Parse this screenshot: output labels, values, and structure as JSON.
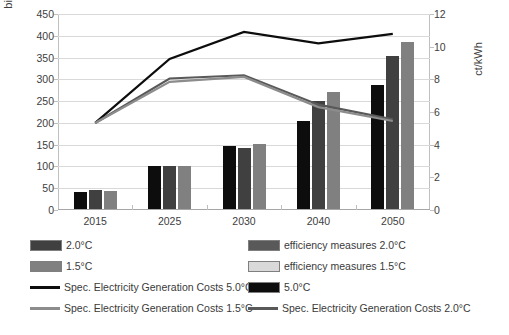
{
  "chart_data": {
    "type": "bar",
    "title": "",
    "categories": [
      "2015",
      "2025",
      "2030",
      "2040",
      "2050"
    ],
    "xlabel": "",
    "ylabel": "billion $",
    "ylabel_secondary": "ct/kWh",
    "ylim": [
      0,
      450
    ],
    "ylim_secondary": [
      0,
      12
    ],
    "yticks": [
      0,
      50,
      100,
      150,
      200,
      250,
      300,
      350,
      400,
      450
    ],
    "yticks_secondary": [
      0,
      2,
      4,
      6,
      8,
      10,
      12
    ],
    "grid": true,
    "legend_position": "bottom",
    "bar_series": [
      {
        "name": "5.0°C",
        "color": "#0d0d0d",
        "axis": "left",
        "values": [
          40,
          99,
          145,
          203,
          284
        ]
      },
      {
        "name": "2.0°C",
        "color": "#404040",
        "axis": "left",
        "values": [
          43,
          99,
          140,
          247,
          352
        ]
      },
      {
        "name": "1.5°C",
        "color": "#808080",
        "axis": "left",
        "values": [
          41,
          99,
          150,
          268,
          383
        ]
      }
    ],
    "line_series": [
      {
        "name": "Spec. Electricity Generation Costs 5.0°C",
        "color": "#0d0d0d",
        "axis": "right",
        "values": [
          5.33,
          9.25,
          10.9,
          10.2,
          10.78
        ]
      },
      {
        "name": "Spec. Electricity Generation Costs 2.0°C",
        "color": "#595959",
        "axis": "right",
        "values": [
          5.33,
          8.05,
          8.25,
          6.45,
          5.55
        ]
      },
      {
        "name": "Spec. Electricity Generation Costs 1.5°C",
        "color": "#8c8c8c",
        "axis": "right",
        "values": [
          5.33,
          7.85,
          8.15,
          6.3,
          5.45
        ]
      }
    ]
  },
  "axes": {
    "left_title": "billion $",
    "right_title": "ct/kWh",
    "left_ticks": [
      "450",
      "400",
      "350",
      "300",
      "250",
      "200",
      "150",
      "100",
      "50",
      "0"
    ],
    "right_ticks": [
      "12",
      "10",
      "8",
      "6",
      "4",
      "2",
      "0"
    ],
    "x_ticks": [
      "2015",
      "2025",
      "2030",
      "2040",
      "2050"
    ]
  },
  "legend": {
    "left_column": [
      {
        "label": "2.0°C",
        "type": "bar",
        "color": "#404040"
      },
      {
        "label": "1.5°C",
        "type": "bar",
        "color": "#808080"
      },
      {
        "label": "Spec. Electricity Generation Costs 5.0°C",
        "type": "line",
        "color": "#0d0d0d"
      },
      {
        "label": "Spec. Electricity Generation Costs 1.5°C",
        "type": "line",
        "color": "#8c8c8c"
      }
    ],
    "right_column": [
      {
        "label": "efficiency measures 2.0°C",
        "type": "bar",
        "color": "#595959"
      },
      {
        "label": "efficiency measures 1.5°C",
        "type": "bar",
        "color": "#d9d9d9"
      },
      {
        "label": "5.0°C",
        "type": "bar",
        "color": "#0d0d0d"
      },
      {
        "label": "Spec. Electricity Generation Costs 2.0°C",
        "type": "line",
        "color": "#595959"
      }
    ]
  }
}
